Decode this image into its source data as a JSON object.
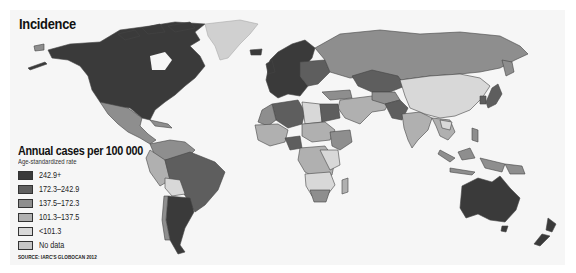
{
  "title": "Incidence",
  "legend": {
    "title": "Annual cases per 100 000",
    "subtitle": "Age-standardized rate",
    "items": [
      {
        "label": "242.9+",
        "color": "#3a3a3a"
      },
      {
        "label": "172.3–242.9",
        "color": "#5e5e5e"
      },
      {
        "label": "137.5–172.3",
        "color": "#8e8e8e"
      },
      {
        "label": "101.3–137.5",
        "color": "#b0b0b0"
      },
      {
        "label": "<101.3",
        "color": "#d8d8d8"
      },
      {
        "label": "No data",
        "color": "#c6c6c6"
      }
    ]
  },
  "source": "SOURCE: IARC'S GLOBOCAN 2012",
  "regions": [
    {
      "name": "North America (USA/Canada)",
      "class": "242.9+"
    },
    {
      "name": "Greenland",
      "class": "No data"
    },
    {
      "name": "Mexico & Central America",
      "class": "137.5–172.3"
    },
    {
      "name": "Brazil",
      "class": "172.3–242.9"
    },
    {
      "name": "Argentina",
      "class": "242.9+"
    },
    {
      "name": "Bolivia",
      "class": "<101.3"
    },
    {
      "name": "Western & Northern Europe",
      "class": "242.9+"
    },
    {
      "name": "Russia",
      "class": "137.5–172.3"
    },
    {
      "name": "Kazakhstan",
      "class": "172.3–242.9"
    },
    {
      "name": "China",
      "class": "<101.3"
    },
    {
      "name": "India",
      "class": "101.3–137.5"
    },
    {
      "name": "Pakistan",
      "class": "172.3–242.9"
    },
    {
      "name": "Japan",
      "class": "172.3–242.9"
    },
    {
      "name": "Algeria",
      "class": "172.3–242.9"
    },
    {
      "name": "Egypt",
      "class": "172.3–242.9"
    },
    {
      "name": "Nigeria",
      "class": "172.3–242.9"
    },
    {
      "name": "Australia",
      "class": "242.9+"
    },
    {
      "name": "New Zealand",
      "class": "242.9+"
    }
  ]
}
